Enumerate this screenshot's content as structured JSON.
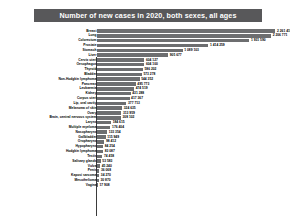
{
  "title": "Number of new cases in 2020, both sexes, all ages",
  "chart_data": {
    "type": "bar",
    "orientation": "horizontal",
    "title": "Number of new cases in 2020, both sexes, all ages",
    "xlabel": "",
    "ylabel": "",
    "xlim": [
      0,
      2250000
    ],
    "grid": false,
    "legend": null,
    "bar_color": "#6d6e70",
    "title_banner_color": "#58585a",
    "xticks": [
      0,
      500000,
      1000000,
      1500000,
      2000000
    ],
    "xtick_labels": [
      "0",
      "500 000",
      "1 000 000",
      "1 500 000",
      "2 000 000"
    ],
    "categories": [
      "Breast",
      "Lung",
      "Colorectum",
      "Prostate",
      "Stomach",
      "Liver",
      "Cervix uteri",
      "Oesophagus",
      "Thyroid",
      "Bladder",
      "Non-Hodgkin lymphoma",
      "Pancreas",
      "Leukaemia",
      "Kidney",
      "Corpus uteri",
      "Lip, oral cavity",
      "Melanoma of skin",
      "Ovary",
      "Brain, central nervous system",
      "Larynx",
      "Multiple myeloma",
      "Nasopharynx",
      "Gallbladder",
      "Oropharynx",
      "Hypopharynx",
      "Hodgkin lymphoma",
      "Testis",
      "Salivary glands",
      "Vulva",
      "Penis",
      "Kaposi sarcoma",
      "Mesothelioma",
      "Vagina"
    ],
    "values": [
      2261419,
      2206771,
      1931590,
      1414259,
      1089103,
      905677,
      604127,
      604100,
      586202,
      573278,
      544352,
      495773,
      474519,
      431288,
      417367,
      377713,
      324635,
      313959,
      308102,
      184615,
      176404,
      133354,
      115949,
      98412,
      84254,
      83087,
      74458,
      53583,
      45240,
      36068,
      34270,
      30870,
      17908
    ],
    "value_labels": [
      "2 261 419",
      "2 206 771",
      "1 931 590",
      "1 414 259",
      "1 089 103",
      "905 677",
      "604 127",
      "604 100",
      "586 202",
      "573 278",
      "544 352",
      "495 773",
      "474 519",
      "431 288",
      "417 367",
      "377 713",
      "324 635",
      "313 959",
      "308 102",
      "184 615",
      "176 404",
      "133 354",
      "115 949",
      "98 412",
      "84 254",
      "83 087",
      "74 458",
      "53 583",
      "45 240",
      "36 068",
      "34 270",
      "30 870",
      "17 908"
    ]
  }
}
